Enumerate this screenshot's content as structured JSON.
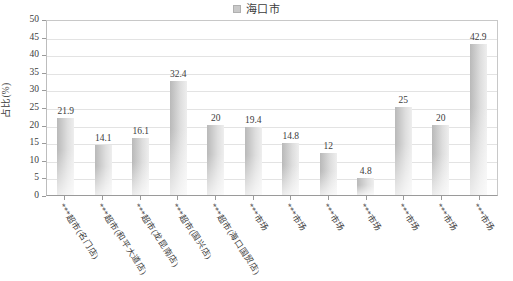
{
  "legend": {
    "marker_name": "legend-swatch",
    "series_label": "海口市",
    "marker_color": "#c9c9c9",
    "position": "top-center"
  },
  "axes": {
    "y_title": "占比(%)",
    "y_ticks": [
      "50",
      "45",
      "40",
      "35",
      "30",
      "25",
      "20",
      "15",
      "10",
      "5",
      "0"
    ]
  },
  "chart_data": {
    "type": "bar",
    "title": "",
    "subtitle": "",
    "xlabel": "",
    "ylabel": "占比(%)",
    "ylim": [
      0,
      50
    ],
    "ytick_step": 5,
    "grid": true,
    "legend_position": "top-center",
    "series": [
      {
        "name": "海口市",
        "color": "#c6c6c6",
        "values": [
          21.9,
          14.1,
          16.1,
          32.4,
          20,
          19.4,
          14.8,
          12,
          4.8,
          25,
          20,
          42.9
        ]
      }
    ],
    "categories": [
      "***超市(名门店)",
      "***超市(和平大道店)",
      "***超市(龙昆南店)",
      "***超市(国兴店)",
      "***超市(海口国贸店)",
      "***市场",
      "***市场",
      "***市场",
      "***市场",
      "***市场",
      "***市场",
      "***市场"
    ],
    "data_labels": [
      "21.9",
      "14.1",
      "16.1",
      "32.4",
      "20",
      "19.4",
      "14.8",
      "12",
      "4.8",
      "25",
      "20",
      "42.9"
    ]
  }
}
